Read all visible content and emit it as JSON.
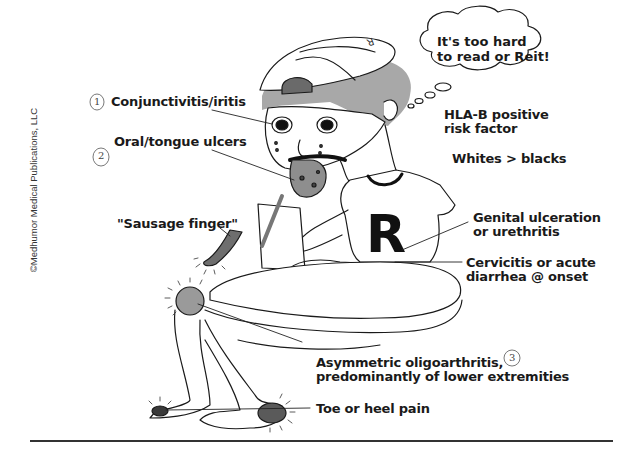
{
  "illustration": {
    "subject": "Reiter syndrome (reactive arthritis) mnemonic cartoon",
    "copyright": "©Medhumor Medical Publications, LLC",
    "thought_bubble": {
      "line1": "It's too hard",
      "line2": "to read or Reit!"
    },
    "shirt_letter": "R",
    "cap_letter": "R",
    "annotations": [
      {
        "id": "conjunctivitis",
        "number": "1",
        "text": "Conjunctivitis/iritis"
      },
      {
        "id": "oral-ulcers",
        "number": "2",
        "text": "Oral/tongue ulcers"
      },
      {
        "id": "sausage-finger",
        "text": "\"Sausage finger\""
      },
      {
        "id": "hla-b",
        "line1": "HLA-B positive",
        "line2": "risk factor"
      },
      {
        "id": "demographics",
        "text": "Whites > blacks"
      },
      {
        "id": "genital",
        "line1": "Genital ulceration",
        "line2": "or urethritis"
      },
      {
        "id": "cervicitis",
        "line1": "Cervicitis or acute",
        "line2": "diarrhea @ onset"
      },
      {
        "id": "oligoarthritis",
        "number": "3",
        "line1": "Asymmetric oligoarthritis,",
        "line2": "predominantly of lower extremities"
      },
      {
        "id": "toe-heel",
        "text": "Toe or heel pain"
      }
    ],
    "colors": {
      "ink": "#1a1a1a",
      "gray_fill": "#9a9a9a",
      "dark_gray": "#5a5a5a",
      "background": "#ffffff"
    }
  }
}
